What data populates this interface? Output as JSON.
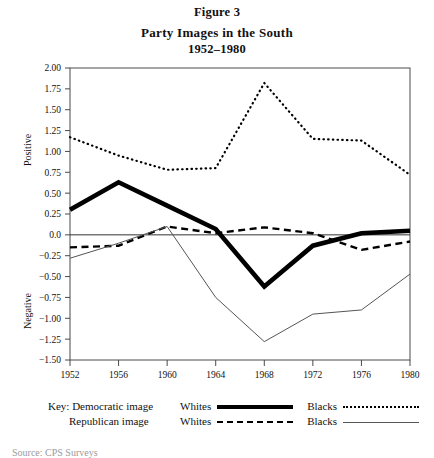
{
  "figure": {
    "label": "Figure 3",
    "title": "Party Images in the South",
    "subtitle": "1952–1980"
  },
  "source_note": "Source: CPS Surveys",
  "axes": {
    "y_positive_label": "Positive",
    "y_negative_label": "Negative",
    "y_ticks": [
      "2.00",
      "1.75",
      "1.50",
      "1.25",
      "1.00",
      "0.75",
      "0.50",
      "0.25",
      "0.0",
      "−0.25",
      "−0.50",
      "−0.75",
      "−1.00",
      "−1.25",
      "−1.50"
    ],
    "x_ticks": [
      "1952",
      "1956",
      "1960",
      "1964",
      "1968",
      "1972",
      "1976",
      "1980"
    ]
  },
  "legend": {
    "key_word": "Key:",
    "rows": [
      {
        "party": "Democratic image",
        "left_group_label": "Whites",
        "left_style": "thick-solid",
        "right_group_label": "Blacks",
        "right_style": "dotted"
      },
      {
        "party": "Republican image",
        "left_group_label": "Whites",
        "left_style": "dashed",
        "right_group_label": "Blacks",
        "right_style": "thin-solid"
      }
    ]
  },
  "chart_data": {
    "type": "line",
    "title": "Party Images in the South",
    "subtitle": "1952–1980",
    "xlabel": "",
    "ylabel": "Positive / Negative",
    "xlim": [
      1952,
      1980
    ],
    "ylim": [
      -1.5,
      2.0
    ],
    "ytick_step": 0.25,
    "grid": false,
    "zero_line": true,
    "legend_position": "below",
    "x": [
      1952,
      1956,
      1960,
      1964,
      1968,
      1972,
      1976,
      1980
    ],
    "series": [
      {
        "name": "Democratic image — Whites",
        "style": "thick-solid",
        "color": "#000000",
        "values": [
          0.3,
          0.63,
          0.35,
          0.07,
          -0.62,
          -0.13,
          0.02,
          0.05
        ]
      },
      {
        "name": "Democratic image — Blacks",
        "style": "dotted",
        "color": "#000000",
        "values": [
          1.17,
          0.95,
          0.78,
          0.8,
          1.82,
          1.15,
          1.13,
          0.72
        ]
      },
      {
        "name": "Republican image — Whites",
        "style": "dashed",
        "color": "#000000",
        "values": [
          -0.15,
          -0.13,
          0.1,
          0.02,
          0.09,
          0.02,
          -0.18,
          -0.08
        ]
      },
      {
        "name": "Republican image — Blacks",
        "style": "thin-solid",
        "color": "#555555",
        "values": [
          -0.28,
          -0.1,
          0.1,
          -0.75,
          -1.28,
          -0.95,
          -0.9,
          -0.47
        ]
      }
    ]
  }
}
